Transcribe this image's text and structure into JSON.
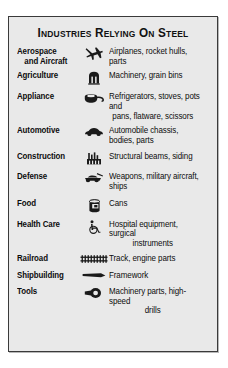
{
  "title": "Industries Relying on Steel",
  "columns": [
    "Industry",
    "Icon",
    "Steel Products"
  ],
  "rows": [
    {
      "industry_line1": "Aerospace",
      "industry_line2": "and Aircraft",
      "icon": "airplane-icon",
      "desc_line1": "Airplanes, rocket hulls, parts",
      "desc_line2": ""
    },
    {
      "industry_line1": "Agriculture",
      "industry_line2": "",
      "icon": "grain-silo-icon",
      "desc_line1": "Machinery, grain bins",
      "desc_line2": ""
    },
    {
      "industry_line1": "Appliance",
      "industry_line2": "",
      "icon": "saucepan-icon",
      "desc_line1": "Refrigerators, stoves, pots and",
      "desc_line2": "pans, flatware, scissors"
    },
    {
      "industry_line1": "Automotive",
      "industry_line2": "",
      "icon": "car-icon",
      "desc_line1": "Automobile chassis, bodies, parts",
      "desc_line2": ""
    },
    {
      "industry_line1": "Construction",
      "industry_line2": "",
      "icon": "factory-icon",
      "desc_line1": "Structural beams, siding",
      "desc_line2": ""
    },
    {
      "industry_line1": "Defense",
      "industry_line2": "",
      "icon": "tank-icon",
      "desc_line1": "Weapons, military aircraft, ships",
      "desc_line2": ""
    },
    {
      "industry_line1": "Food",
      "industry_line2": "",
      "icon": "can-icon",
      "desc_line1": "Cans",
      "desc_line2": ""
    },
    {
      "industry_line1": "Health Care",
      "industry_line2": "",
      "icon": "wheelchair-icon",
      "desc_line1": "Hospital equipment, surgical",
      "desc_line2": "instruments"
    },
    {
      "industry_line1": "Railroad",
      "industry_line2": "",
      "icon": "railroad-track-icon",
      "desc_line1": "Track, engine parts",
      "desc_line2": ""
    },
    {
      "industry_line1": "Shipbuilding",
      "industry_line2": "",
      "icon": "i-beam-icon",
      "desc_line1": "Framework",
      "desc_line2": ""
    },
    {
      "industry_line1": "Tools",
      "industry_line2": "",
      "icon": "drill-bit-icon",
      "desc_line1": "Machinery parts, high-speed",
      "desc_line2": "drills"
    }
  ],
  "colors": {
    "panel_background": "#e9e9e9",
    "panel_border": "#3a3a3a",
    "text": "#0d0d0d",
    "page_background": "#ffffff"
  }
}
